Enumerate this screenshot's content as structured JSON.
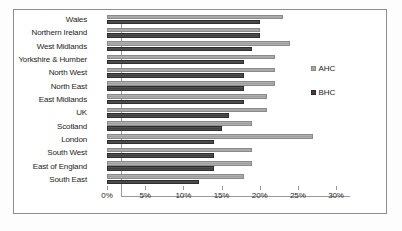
{
  "chart_data": {
    "type": "bar",
    "orientation": "horizontal",
    "title": "",
    "subtitle": "",
    "xlabel": "",
    "ylabel": "",
    "xlim": [
      0,
      30
    ],
    "xticks": [
      "0%",
      "5%",
      "10%",
      "15%",
      "20%",
      "25%",
      "30%"
    ],
    "xtick_values": [
      0,
      5,
      10,
      15,
      20,
      25,
      30
    ],
    "grid": false,
    "legend_position": "right",
    "categories": [
      "Wales",
      "Northern Ireland",
      "West Midlands",
      "Yorkshire & Humber",
      "North West",
      "North East",
      "East Midlands",
      "UK",
      "Scotland",
      "London",
      "South West",
      "East of England",
      "South East"
    ],
    "series": [
      {
        "name": "AHC",
        "color": "#a6a6a6",
        "values": [
          23,
          20,
          24,
          22,
          22,
          22,
          21,
          21,
          19,
          27,
          19,
          19,
          18
        ]
      },
      {
        "name": "BHC",
        "color": "#404040",
        "values": [
          20,
          20,
          19,
          18,
          18,
          18,
          18,
          16,
          15,
          14,
          14,
          14,
          12
        ]
      }
    ]
  },
  "legend": {
    "entries": [
      {
        "label": "AHC"
      },
      {
        "label": "BHC"
      }
    ]
  }
}
